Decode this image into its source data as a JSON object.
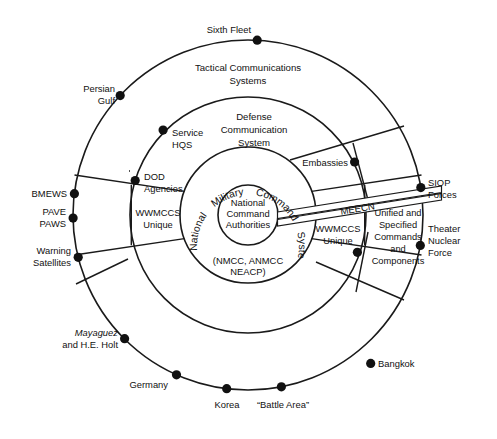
{
  "diagram": {
    "colors": {
      "stroke": "#1a1a1a",
      "dot": "#111111",
      "background": "#ffffff"
    },
    "rings": [
      {
        "name": "outer-ring",
        "label": "Tactical Communications Systems",
        "label_line1": "Tactical Communications",
        "label_line2": "Systems"
      },
      {
        "name": "middle-ring",
        "label": "Defense Communication System",
        "label_line1": "Defense",
        "label_line2": "Communication",
        "label_line3": "System"
      },
      {
        "name": "nmcs-ring",
        "label": "National Military Command System",
        "arc_words": [
          "National",
          "Military",
          "Command",
          "System"
        ]
      },
      {
        "name": "core-circle",
        "label": "National Command Authorities",
        "label_line1": "National",
        "label_line2": "Command",
        "label_line3": "Authorities"
      }
    ],
    "core_subtitle": {
      "line1": "(NMCC, ANMCC",
      "line2": "NEACP)"
    },
    "sectors": {
      "left_label_line1": "WWMCCS",
      "left_label_line2": "Unique",
      "right_label_line1": "WWMCCS",
      "right_label_line2": "Unique",
      "right_outer_line1": "Unified and",
      "right_outer_line2": "Specified",
      "right_outer_line3": "Commands",
      "right_outer_line4": "and",
      "right_outer_line5": "Components"
    },
    "band": {
      "label": "MEECN"
    },
    "nodes_outer": [
      {
        "name": "sixth-fleet",
        "label": "Sixth Fleet",
        "angle_deg": -87
      },
      {
        "name": "persian-gulf",
        "label_line1": "Persian",
        "label_line2": "Gulf",
        "angle_deg": -137
      },
      {
        "name": "bmews",
        "label": "BMEWS",
        "angle_deg": 187
      },
      {
        "name": "pave-paws",
        "label_line1": "PAVE",
        "label_line2": "PAWS",
        "angle_deg": 181
      },
      {
        "name": "warning-satellites",
        "label_line1": "Warning",
        "label_line2": "Satellites",
        "angle_deg": 166
      },
      {
        "name": "mayaguez-holt",
        "label_line1": "Mayaguez",
        "label_line2": "and H.E. Holt",
        "angle_deg": 135,
        "italic_line1": true
      },
      {
        "name": "germany",
        "label": "Germany",
        "angle_deg": 114
      },
      {
        "name": "korea",
        "label": "Korea",
        "angle_deg": 97
      },
      {
        "name": "battle-area",
        "label": "“Battle Area”",
        "angle_deg": 79
      },
      {
        "name": "bangkok",
        "label": "Bangkok",
        "angle_deg": 58
      },
      {
        "name": "theater-nuclear-force",
        "label_line1": "Theater",
        "label_line2": "Nuclear",
        "label_line3": "Force",
        "angle_deg": 10
      },
      {
        "name": "siop-forces",
        "label_line1": "SIOP",
        "label_line2": "Forces",
        "angle_deg": -9
      }
    ],
    "nodes_middle": [
      {
        "name": "service-hqs",
        "label_line1": "Service",
        "label_line2": "HQS",
        "angle_deg": -136
      },
      {
        "name": "dod-agencies",
        "label_line1": "DOD",
        "label_line2": "Agencies",
        "angle_deg": -163
      },
      {
        "name": "embassies",
        "label": "Embassies",
        "angle_deg": -52
      },
      {
        "name": "wwmccs-node-right",
        "label": "",
        "angle_deg": 22
      }
    ]
  }
}
